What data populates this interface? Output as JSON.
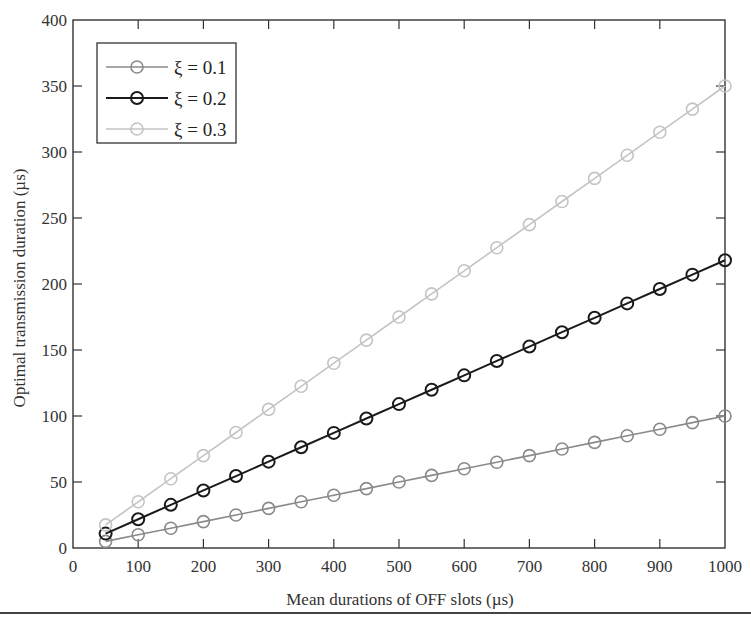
{
  "chart_data": {
    "type": "line",
    "title": "",
    "xlabel": "Mean durations of OFF slots (µs)",
    "ylabel": "Optimal transmission duration (µs)",
    "xlim": [
      0,
      1000
    ],
    "ylim": [
      0,
      400
    ],
    "xticks": [
      0,
      100,
      200,
      300,
      400,
      500,
      600,
      700,
      800,
      900,
      1000
    ],
    "yticks": [
      0,
      50,
      100,
      150,
      200,
      250,
      300,
      350,
      400
    ],
    "grid": false,
    "legend_position": "upper left",
    "x": [
      50,
      100,
      150,
      200,
      250,
      300,
      350,
      400,
      450,
      500,
      550,
      600,
      650,
      700,
      750,
      800,
      850,
      900,
      950,
      1000
    ],
    "series": [
      {
        "name": "ξ = 0.1",
        "color": "#8a8a8a",
        "marker": "circle-open",
        "values": [
          5,
          10,
          15,
          20,
          25,
          30,
          35,
          40,
          45,
          50,
          55,
          60,
          65,
          70,
          75,
          80,
          85,
          90,
          95,
          100
        ]
      },
      {
        "name": "ξ = 0.2",
        "color": "#1a1a1a",
        "marker": "circle-open",
        "values": [
          10.9,
          21.8,
          32.7,
          43.6,
          54.5,
          65.4,
          76.3,
          87.2,
          98.1,
          109,
          119.9,
          130.8,
          141.7,
          152.6,
          163.5,
          174.4,
          185.3,
          196.2,
          207.1,
          218
        ]
      },
      {
        "name": "ξ = 0.3",
        "color": "#c4c4c4",
        "marker": "circle-open",
        "values": [
          17.5,
          35,
          52.5,
          70,
          87.5,
          105,
          122.5,
          140,
          157.5,
          175,
          192.5,
          210,
          227.5,
          245,
          262.5,
          280,
          297.5,
          315,
          332.5,
          350
        ]
      }
    ]
  }
}
